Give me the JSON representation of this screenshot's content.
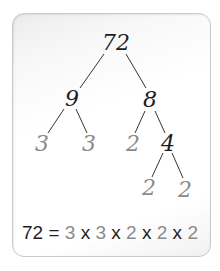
{
  "diagram": {
    "nodes": [
      {
        "id": "n72",
        "label": "72",
        "x": 116,
        "y": 43,
        "type": "composite"
      },
      {
        "id": "n9",
        "label": "9",
        "x": 72,
        "y": 99,
        "type": "composite"
      },
      {
        "id": "n8",
        "label": "8",
        "x": 150,
        "y": 100,
        "type": "composite"
      },
      {
        "id": "n3a",
        "label": "3",
        "x": 42,
        "y": 144,
        "type": "prime"
      },
      {
        "id": "n3b",
        "label": "3",
        "x": 89,
        "y": 144,
        "type": "prime"
      },
      {
        "id": "n2a",
        "label": "2",
        "x": 133,
        "y": 144,
        "type": "prime"
      },
      {
        "id": "n4",
        "label": "4",
        "x": 168,
        "y": 144,
        "type": "composite"
      },
      {
        "id": "n2b",
        "label": "2",
        "x": 149,
        "y": 188,
        "type": "prime"
      },
      {
        "id": "n2c",
        "label": "2",
        "x": 185,
        "y": 190,
        "type": "prime"
      }
    ],
    "edges": [
      [
        "n72",
        "n9"
      ],
      [
        "n72",
        "n8"
      ],
      [
        "n9",
        "n3a"
      ],
      [
        "n9",
        "n3b"
      ],
      [
        "n8",
        "n2a"
      ],
      [
        "n8",
        "n4"
      ],
      [
        "n4",
        "n2b"
      ],
      [
        "n4",
        "n2c"
      ]
    ],
    "equation": {
      "lhs": "72 =",
      "factors": [
        "3",
        "3",
        "2",
        "2",
        "2"
      ],
      "operator": "x"
    },
    "colors": {
      "composite": "#1e1e1e",
      "prime": "#8a8a8a",
      "line": "#333333"
    }
  }
}
